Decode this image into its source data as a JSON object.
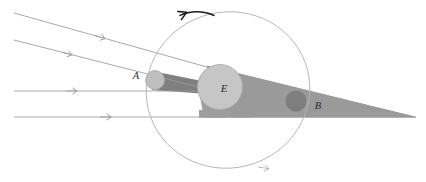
{
  "figure": {
    "type": "astronomy-diagram",
    "background_color": "#ffffff"
  },
  "labels": {
    "earth": "E",
    "position_a": "A",
    "position_b": "B"
  },
  "colors": {
    "sunlight_ray": "#9a9a9a",
    "penumbra_fill": "#9e9e9e",
    "umbra_fill": "#8a8a8a",
    "earth_fill": "#c3c3c3",
    "earth_stroke": "#a8a8a8",
    "moon_a_fill": "#bdbdbd",
    "moon_b_fill": "#7e7e7e",
    "orbit_stroke": "#b0b0b0",
    "direction_arrow": "#1a1a1a",
    "label_text": "#2b2b2b"
  },
  "sunlight_rays": [
    {
      "name": "ray-1-slanted-upper",
      "x1": 14,
      "y1": 13,
      "x2": 230,
      "y2": 74,
      "arrow_t": 0.44
    },
    {
      "name": "ray-2-slanted-lower",
      "x1": 14,
      "y1": 40,
      "x2": 232,
      "y2": 96,
      "arrow_t": 0.34
    },
    {
      "name": "ray-3-horizontal-upper",
      "x1": 14,
      "y1": 91,
      "x2": 246,
      "y2": 91,
      "arrow_t": 0.34
    },
    {
      "name": "ray-4-horizontal-lower",
      "x1": 14,
      "y1": 117,
      "x2": 250,
      "y2": 117,
      "arrow_t": 0.42
    }
  ],
  "earth": {
    "cx": 220,
    "cy": 87,
    "r": 22
  },
  "moon_positions": {
    "a": {
      "cx": 155,
      "cy": 80,
      "r": 9.5,
      "label_x": 136,
      "label_y": 79
    },
    "b": {
      "cx": 296,
      "cy": 101,
      "r": 10.5,
      "label_x": 318,
      "label_y": 109
    }
  },
  "shadow_cone": {
    "description": "tapering penumbra/umbra wedge cast to the right of Earth",
    "tip_x": 416,
    "tip_y": 117
  },
  "orbit": {
    "cx": 228,
    "cy": 90,
    "rx": 82,
    "ry": 78,
    "rotation_deg": -14,
    "direction": "retrograde-left-at-top",
    "arrow_top_label": "orbit-direction-arrow-top",
    "arrow_bottom_label": "orbit-direction-arrow-bottom"
  }
}
